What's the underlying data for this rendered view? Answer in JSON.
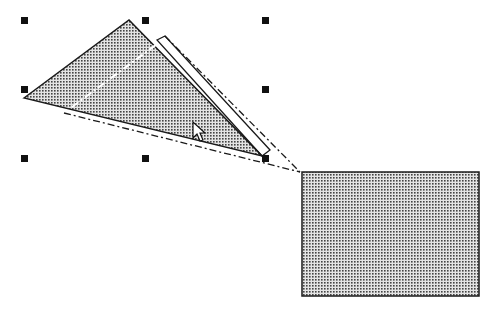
{
  "canvas": {
    "width": 492,
    "height": 310,
    "background": "#ffffff"
  },
  "colors": {
    "stroke": "#1a1a1a",
    "dot": "#333333",
    "fill_bg": "#d8d8d8"
  },
  "triangle": {
    "points": [
      [
        24,
        98
      ],
      [
        129,
        20
      ],
      [
        262,
        156
      ]
    ],
    "fill": "dotted-gray"
  },
  "rotation_preview": {
    "outline_points": [
      [
        157,
        40
      ],
      [
        165,
        36
      ],
      [
        300,
        172
      ],
      [
        64,
        113
      ]
    ],
    "style": "dashed"
  },
  "rectangle": {
    "x": 302,
    "y": 172,
    "width": 177,
    "height": 124,
    "fill": "dotted-gray"
  },
  "selection_handles": [
    {
      "x": 24,
      "y": 20
    },
    {
      "x": 145,
      "y": 20
    },
    {
      "x": 265,
      "y": 20
    },
    {
      "x": 24,
      "y": 89
    },
    {
      "x": 265,
      "y": 89
    },
    {
      "x": 24,
      "y": 158
    },
    {
      "x": 145,
      "y": 158
    },
    {
      "x": 265,
      "y": 158
    }
  ],
  "cursor": {
    "type": "arrow",
    "x": 193,
    "y": 122
  }
}
